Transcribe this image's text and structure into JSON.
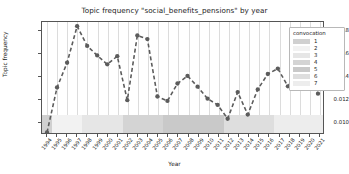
{
  "chart_data": {
    "type": "line",
    "title": "Topic frequency \"social_benefits_pensions\" by year",
    "xlabel": "Year",
    "ylabel": "Topic frequency",
    "grid": "vertical",
    "legend_position": "upper-right-outside",
    "ylim": [
      0.009,
      0.0188
    ],
    "yticks": [
      0.01,
      0.012,
      0.014,
      0.016,
      0.018
    ],
    "ytick_labels": [
      "0.010",
      "0.012",
      "0.014",
      "0.016",
      "0.018"
    ],
    "categories": [
      "1994",
      "1995",
      "1996",
      "1997",
      "1998",
      "1999",
      "2000",
      "2001",
      "2002",
      "2003",
      "2004",
      "2005",
      "2006",
      "2007",
      "2008",
      "2009",
      "2010",
      "2011",
      "2012",
      "2013",
      "2014",
      "2015",
      "2016",
      "2017",
      "2018",
      "2019",
      "2020",
      "2021"
    ],
    "series": [
      {
        "name": "social_benefits_pensions",
        "color": "#5c5c5c",
        "linestyle": "dashed",
        "marker": "circle",
        "values": [
          0.00905,
          0.01302,
          0.0152,
          0.01843,
          0.01669,
          0.01585,
          0.01506,
          0.01578,
          0.0119,
          0.01761,
          0.01729,
          0.01222,
          0.01183,
          0.01337,
          0.01404,
          0.01309,
          0.01203,
          0.01148,
          0.01026,
          0.01261,
          0.01063,
          0.01285,
          0.01421,
          0.01469,
          0.01312,
          0.01431,
          0.01458,
          0.01247
        ]
      }
    ],
    "convocation_bands": [
      {
        "label": "1",
        "start_year": "1994",
        "end_year": "1995",
        "color": "#d0d0d0"
      },
      {
        "label": "2",
        "start_year": "1995",
        "end_year": "1998",
        "color": "#f2f2f2"
      },
      {
        "label": "3",
        "start_year": "1998",
        "end_year": "2002",
        "color": "#e6e6e6"
      },
      {
        "label": "4",
        "start_year": "2002",
        "end_year": "2006",
        "color": "#d4d4d4"
      },
      {
        "label": "5",
        "start_year": "2006",
        "end_year": "2012",
        "color": "#c9c9c9"
      },
      {
        "label": "6",
        "start_year": "2012",
        "end_year": "2017",
        "color": "#dedede"
      },
      {
        "label": "7",
        "start_year": "2017",
        "end_year": "2021",
        "color": "#ededed"
      }
    ]
  },
  "legend": {
    "title": "convocation",
    "items": [
      {
        "label": "1",
        "color": "#d0d0d0"
      },
      {
        "label": "2",
        "color": "#f2f2f2"
      },
      {
        "label": "3",
        "color": "#e6e6e6"
      },
      {
        "label": "4",
        "color": "#d4d4d4"
      },
      {
        "label": "5",
        "color": "#c9c9c9"
      },
      {
        "label": "6",
        "color": "#dedede"
      },
      {
        "label": "7",
        "color": "#ededed"
      }
    ]
  }
}
